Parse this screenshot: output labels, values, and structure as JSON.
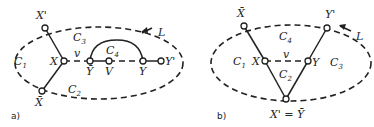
{
  "figure": {
    "panels": [
      {
        "caption": "a)",
        "loop_label": "L",
        "regions": [
          "C",
          "C",
          "C",
          "C"
        ],
        "region_subs": [
          "1",
          "2",
          "3",
          "4"
        ],
        "vertices": {
          "x_prime": "X'",
          "x": "X",
          "x_bar": "X̄",
          "y_bar": "Ȳ",
          "v": "V",
          "y": "Y",
          "y_prime": "Y'"
        },
        "edge_label": "v"
      },
      {
        "caption": "b)",
        "loop_label": "L",
        "regions": [
          "C",
          "C",
          "C",
          "C"
        ],
        "region_subs": [
          "1",
          "2",
          "3",
          "4"
        ],
        "vertices": {
          "x_bar": "X̄",
          "y_prime": "Y'",
          "x": "X",
          "y": "Y",
          "bottom": "X' = Ȳ"
        },
        "edge_label": "v"
      }
    ]
  }
}
